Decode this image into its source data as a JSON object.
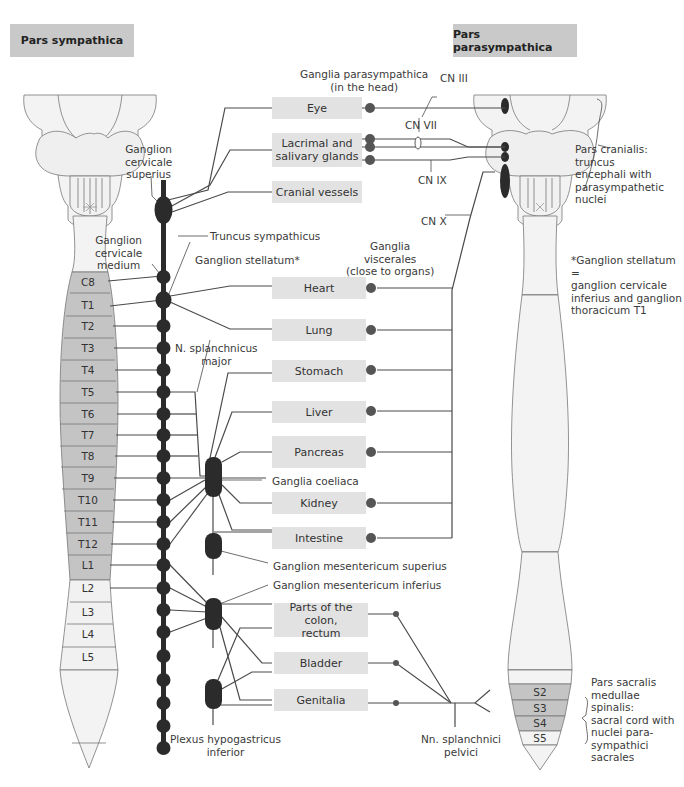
{
  "headers": {
    "left": "Pars sympathica",
    "right": "Pars parasympathica"
  },
  "organs": [
    {
      "label": "Eye"
    },
    {
      "label": "Lacrimal and\nsalivary glands"
    },
    {
      "label": "Cranial vessels"
    },
    {
      "label": "Heart"
    },
    {
      "label": "Lung"
    },
    {
      "label": "Stomach"
    },
    {
      "label": "Liver"
    },
    {
      "label": "Pancreas"
    },
    {
      "label": "Kidney"
    },
    {
      "label": "Intestine"
    },
    {
      "label": "Parts of the colon,\nrectum"
    },
    {
      "label": "Bladder"
    },
    {
      "label": "Genitalia"
    }
  ],
  "spine_left_segments": [
    "C8",
    "T1",
    "T2",
    "T3",
    "T4",
    "T5",
    "T6",
    "T7",
    "T8",
    "T9",
    "T10",
    "T11",
    "T12",
    "L1",
    "L2",
    "L3",
    "L4",
    "L5"
  ],
  "spine_right_segments": [
    "S2",
    "S3",
    "S4",
    "S5"
  ],
  "labels": {
    "ganglion_cervicale_superius": "Ganglion\ncervicale\nsuperius",
    "ganglion_cervicale_medium": "Ganglion\ncervicale\nmedium",
    "truncus_sympathicus": "Truncus sympathicus",
    "ganglion_stellatum": "Ganglion stellatum*",
    "ganglia_parasympathica": "Ganglia parasympathica\n(in the head)",
    "cn_iii": "CN III",
    "cn_vii": "CN VII",
    "cn_ix": "CN IX",
    "cn_x": "CN X",
    "pars_cranialis": "Pars cranialis:\ntruncus\nencephali with\nparasympathetic\nnuclei",
    "ganglia_viscerales": "Ganglia\nviscerales\n(close to organs)",
    "stellatum_note": "*Ganglion stellatum =\nganglion cervicale\ninferius and ganglion\nthoracicum T1",
    "n_splanchnicus_major": "N. splanchnicus\nmajor",
    "ganglia_coeliaca": "Ganglia coeliaca",
    "ganglion_mesentericum_superius": "Ganglion mesentericum superius",
    "ganglion_mesentericum_inferius": "Ganglion mesentericum inferius",
    "plexus_hypogastricus": "Plexus hypogastricus\ninferior",
    "nn_splanchnici_pelvici": "Nn. splanchnici\npelvici",
    "pars_sacralis": "Pars sacralis\nmedullae spinalis:\nsacral cord with\nnuclei para-\nsympathici\nsacrales"
  },
  "colors": {
    "header_bg": "#c9c9c9",
    "organ_box_bg": "#e2e2e2",
    "spinal_segment_gray": "#c4c4c4",
    "spinal_light": "#f2f2f2",
    "ganglion_dark": "#2b2b2b",
    "line": "#4a4a4a"
  }
}
